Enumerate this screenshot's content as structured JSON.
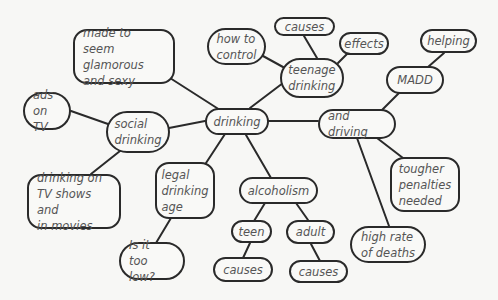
{
  "diagram": {
    "type": "mind-map",
    "central_topic": "drinking",
    "nodes": [
      {
        "id": "drinking",
        "label": "drinking",
        "x": 205,
        "y": 108,
        "w": 64,
        "h": 27,
        "shape": "pill"
      },
      {
        "id": "social",
        "label": "social\ndrinking",
        "x": 106,
        "y": 111,
        "w": 64,
        "h": 42,
        "shape": "pill"
      },
      {
        "id": "ads",
        "label": "ads\non TV",
        "x": 23,
        "y": 92,
        "w": 48,
        "h": 38,
        "shape": "pill"
      },
      {
        "id": "glam",
        "label": "made to seem\nglamorous\nand sexy",
        "x": 73,
        "y": 29,
        "w": 102,
        "h": 55,
        "shape": "rounded"
      },
      {
        "id": "tvshows",
        "label": "drinking on\nTV shows and\nin movies",
        "x": 27,
        "y": 174,
        "w": 94,
        "h": 55,
        "shape": "rounded"
      },
      {
        "id": "teenage",
        "label": "teenage\ndrinking",
        "x": 280,
        "y": 58,
        "w": 64,
        "h": 40,
        "shape": "pill"
      },
      {
        "id": "howto",
        "label": "how to\ncontrol",
        "x": 207,
        "y": 28,
        "w": 59,
        "h": 37,
        "shape": "pill"
      },
      {
        "id": "causes_top",
        "label": "causes",
        "x": 274,
        "y": 17,
        "w": 61,
        "h": 19,
        "shape": "pill"
      },
      {
        "id": "effects",
        "label": "effects",
        "x": 339,
        "y": 32,
        "w": 50,
        "h": 23,
        "shape": "pill"
      },
      {
        "id": "anddriving",
        "label": "and driving",
        "x": 318,
        "y": 109,
        "w": 78,
        "h": 30,
        "shape": "pill"
      },
      {
        "id": "madd",
        "label": "MADD",
        "x": 386,
        "y": 66,
        "w": 58,
        "h": 28,
        "shape": "pill"
      },
      {
        "id": "helping",
        "label": "helping",
        "x": 420,
        "y": 29,
        "w": 57,
        "h": 24,
        "shape": "pill"
      },
      {
        "id": "tougher",
        "label": "tougher\npenalties\nneeded",
        "x": 390,
        "y": 157,
        "w": 70,
        "h": 55,
        "shape": "rounded"
      },
      {
        "id": "highrate",
        "label": "high rate\nof deaths",
        "x": 350,
        "y": 226,
        "w": 76,
        "h": 37,
        "shape": "pill"
      },
      {
        "id": "legal",
        "label": "legal\ndrinking\nage",
        "x": 155,
        "y": 162,
        "w": 60,
        "h": 57,
        "shape": "rounded"
      },
      {
        "id": "toolow",
        "label": "Is it\ntoo low?",
        "x": 119,
        "y": 242,
        "w": 66,
        "h": 38,
        "shape": "pill"
      },
      {
        "id": "alcoholism",
        "label": "alcoholism",
        "x": 239,
        "y": 177,
        "w": 79,
        "h": 27,
        "shape": "pill"
      },
      {
        "id": "teen",
        "label": "teen",
        "x": 231,
        "y": 220,
        "w": 41,
        "h": 23,
        "shape": "pill"
      },
      {
        "id": "adult",
        "label": "adult",
        "x": 286,
        "y": 220,
        "w": 49,
        "h": 24,
        "shape": "pill"
      },
      {
        "id": "causes_teen",
        "label": "causes",
        "x": 213,
        "y": 257,
        "w": 60,
        "h": 25,
        "shape": "pill"
      },
      {
        "id": "causes_adult",
        "label": "causes",
        "x": 289,
        "y": 260,
        "w": 59,
        "h": 23,
        "shape": "pill"
      }
    ],
    "edges": [
      {
        "from": "drinking",
        "to": "social",
        "x1": 205,
        "y1": 121,
        "x2": 169,
        "y2": 128
      },
      {
        "from": "social",
        "to": "ads",
        "x1": 108,
        "y1": 124,
        "x2": 71,
        "y2": 111
      },
      {
        "from": "drinking",
        "to": "glam",
        "x1": 220,
        "y1": 110,
        "x2": 170,
        "y2": 78
      },
      {
        "from": "social",
        "to": "tvshows",
        "x1": 120,
        "y1": 151,
        "x2": 91,
        "y2": 174
      },
      {
        "from": "drinking",
        "to": "teenage",
        "x1": 250,
        "y1": 108,
        "x2": 283,
        "y2": 83
      },
      {
        "from": "teenage",
        "to": "howto",
        "x1": 283,
        "y1": 67,
        "x2": 263,
        "y2": 56
      },
      {
        "from": "teenage",
        "to": "causes_top",
        "x1": 317,
        "y1": 58,
        "x2": 304,
        "y2": 36
      },
      {
        "from": "teenage",
        "to": "effects",
        "x1": 338,
        "y1": 63,
        "x2": 348,
        "y2": 53
      },
      {
        "from": "drinking",
        "to": "anddriving",
        "x1": 268,
        "y1": 121,
        "x2": 318,
        "y2": 121
      },
      {
        "from": "anddriving",
        "to": "madd",
        "x1": 382,
        "y1": 110,
        "x2": 399,
        "y2": 93
      },
      {
        "from": "madd",
        "to": "helping",
        "x1": 428,
        "y1": 67,
        "x2": 444,
        "y2": 53
      },
      {
        "from": "anddriving",
        "to": "tougher",
        "x1": 377,
        "y1": 138,
        "x2": 403,
        "y2": 158
      },
      {
        "from": "anddriving",
        "to": "highrate",
        "x1": 357,
        "y1": 138,
        "x2": 389,
        "y2": 226
      },
      {
        "from": "drinking",
        "to": "legal",
        "x1": 225,
        "y1": 134,
        "x2": 206,
        "y2": 163
      },
      {
        "from": "legal",
        "to": "toolow",
        "x1": 171,
        "y1": 218,
        "x2": 156,
        "y2": 243
      },
      {
        "from": "drinking",
        "to": "alcoholism",
        "x1": 246,
        "y1": 135,
        "x2": 271,
        "y2": 178
      },
      {
        "from": "alcoholism",
        "to": "teen",
        "x1": 265,
        "y1": 203,
        "x2": 254,
        "y2": 221
      },
      {
        "from": "alcoholism",
        "to": "adult",
        "x1": 296,
        "y1": 203,
        "x2": 308,
        "y2": 220
      },
      {
        "from": "teen",
        "to": "causes_teen",
        "x1": 250,
        "y1": 243,
        "x2": 243,
        "y2": 258
      },
      {
        "from": "adult",
        "to": "causes_adult",
        "x1": 311,
        "y1": 244,
        "x2": 320,
        "y2": 261
      }
    ],
    "colors": {
      "background": "#f7f7f5",
      "stroke": "#2a2a2a",
      "text": "#555555",
      "node_fill": "#f9f9f7"
    }
  }
}
